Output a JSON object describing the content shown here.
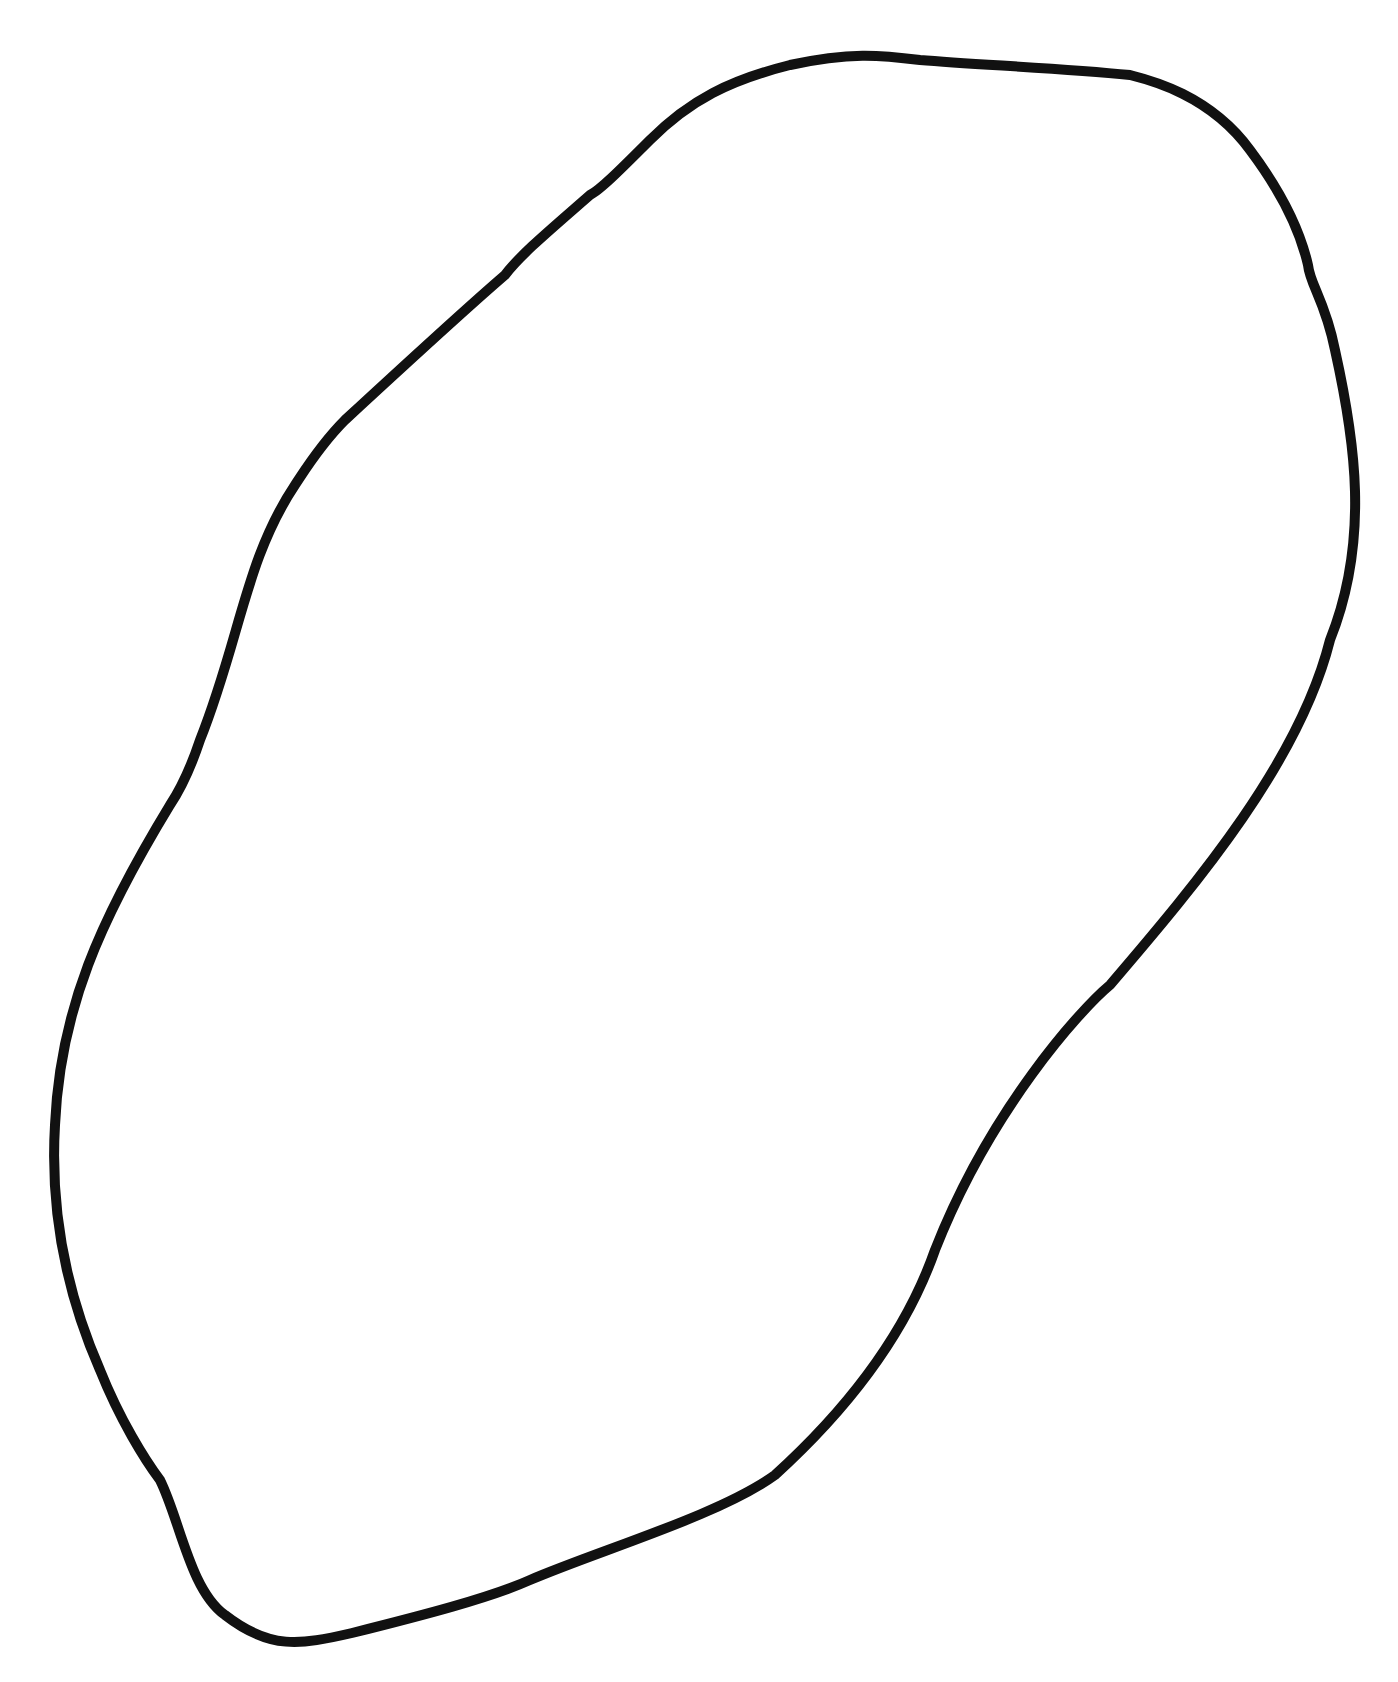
{
  "canvas": {
    "width": 1398,
    "height": 1682,
    "background": "#ffffff"
  },
  "shape": {
    "kind": "closed-outline",
    "stroke_color": "#111111",
    "stroke_width": 10,
    "fill": "none",
    "path": "M 352 1633 C 420 1616 490 1598 530 1580 C 600 1550 720 1515 775 1475 C 830 1425 900 1350 935 1250 C 990 1110 1080 1010 1110 985 C 1200 880 1300 760 1330 640 C 1370 540 1355 440 1335 350 C 1325 300 1310 285 1308 265 C 1300 230 1280 190 1250 150 C 1210 95 1150 80 1130 75 C 1060 68 980 65 920 60 C 880 55 850 52 790 65 C 730 80 690 100 650 140 C 620 170 600 190 590 195 C 550 230 520 255 505 275 C 470 305 410 360 345 420 C 320 445 305 470 295 485 C 245 560 240 640 200 740 C 190 770 180 790 170 805 C 100 920 60 1010 55 1125 C 50 1210 65 1290 100 1370 C 120 1420 145 1460 160 1480 C 180 1520 190 1590 225 1615 C 270 1650 300 1645 352 1633 Z"
  }
}
